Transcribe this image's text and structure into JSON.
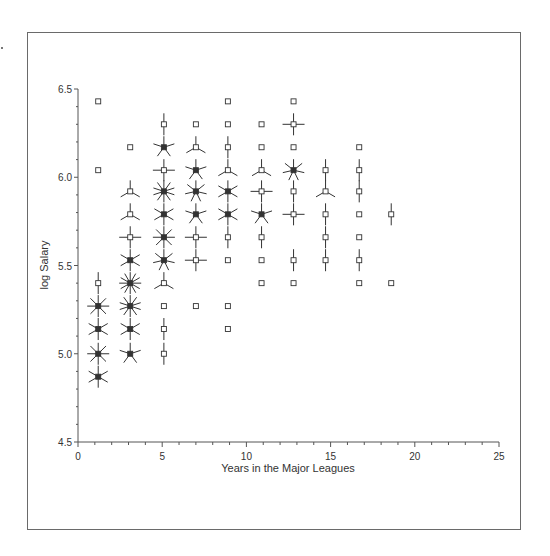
{
  "chart_data": {
    "type": "scatter",
    "subtype": "sunflower",
    "title": "",
    "xlabel": "Years in the Major Leagues",
    "ylabel": "log Salary",
    "xlim": [
      0,
      25
    ],
    "ylim": [
      4.5,
      6.5
    ],
    "xticks": [
      "0",
      "5",
      "10",
      "15",
      "20",
      "25"
    ],
    "yticks": [
      "4.5",
      "5.0",
      "5.5",
      "6.0",
      "6.5"
    ],
    "grid": false,
    "legend": null,
    "note": "Each point is a sunflower; petals = count of observations in the bin (1 = plain square).",
    "points": [
      {
        "x": 1.2,
        "y": 6.43,
        "n": 1
      },
      {
        "x": 1.2,
        "y": 6.04,
        "n": 1
      },
      {
        "x": 1.2,
        "y": 5.4,
        "n": 2
      },
      {
        "x": 1.2,
        "y": 5.27,
        "n": 8
      },
      {
        "x": 1.2,
        "y": 5.14,
        "n": 6
      },
      {
        "x": 1.2,
        "y": 5.0,
        "n": 8
      },
      {
        "x": 1.2,
        "y": 4.87,
        "n": 6
      },
      {
        "x": 3.1,
        "y": 6.17,
        "n": 1
      },
      {
        "x": 3.1,
        "y": 5.92,
        "n": 3
      },
      {
        "x": 3.1,
        "y": 5.79,
        "n": 3
      },
      {
        "x": 3.1,
        "y": 5.66,
        "n": 4
      },
      {
        "x": 3.1,
        "y": 5.53,
        "n": 6
      },
      {
        "x": 3.1,
        "y": 5.4,
        "n": 12
      },
      {
        "x": 3.1,
        "y": 5.27,
        "n": 10
      },
      {
        "x": 3.1,
        "y": 5.14,
        "n": 6
      },
      {
        "x": 3.1,
        "y": 5.0,
        "n": 5
      },
      {
        "x": 5.1,
        "y": 6.3,
        "n": 2
      },
      {
        "x": 5.1,
        "y": 6.17,
        "n": 5
      },
      {
        "x": 5.1,
        "y": 6.04,
        "n": 4
      },
      {
        "x": 5.1,
        "y": 5.92,
        "n": 10
      },
      {
        "x": 5.1,
        "y": 5.79,
        "n": 6
      },
      {
        "x": 5.1,
        "y": 5.66,
        "n": 8
      },
      {
        "x": 5.1,
        "y": 5.53,
        "n": 7
      },
      {
        "x": 5.1,
        "y": 5.4,
        "n": 3
      },
      {
        "x": 5.1,
        "y": 5.27,
        "n": 1
      },
      {
        "x": 5.1,
        "y": 5.14,
        "n": 2
      },
      {
        "x": 5.1,
        "y": 5.0,
        "n": 2
      },
      {
        "x": 7.0,
        "y": 6.3,
        "n": 1
      },
      {
        "x": 7.0,
        "y": 6.17,
        "n": 3
      },
      {
        "x": 7.0,
        "y": 6.04,
        "n": 5
      },
      {
        "x": 7.0,
        "y": 5.92,
        "n": 7
      },
      {
        "x": 7.0,
        "y": 5.79,
        "n": 5
      },
      {
        "x": 7.0,
        "y": 5.66,
        "n": 4
      },
      {
        "x": 7.0,
        "y": 5.53,
        "n": 4
      },
      {
        "x": 7.0,
        "y": 5.27,
        "n": 1
      },
      {
        "x": 8.9,
        "y": 6.43,
        "n": 1
      },
      {
        "x": 8.9,
        "y": 6.3,
        "n": 1
      },
      {
        "x": 8.9,
        "y": 6.17,
        "n": 2
      },
      {
        "x": 8.9,
        "y": 6.04,
        "n": 3
      },
      {
        "x": 8.9,
        "y": 5.92,
        "n": 6
      },
      {
        "x": 8.9,
        "y": 5.79,
        "n": 6
      },
      {
        "x": 8.9,
        "y": 5.66,
        "n": 2
      },
      {
        "x": 8.9,
        "y": 5.53,
        "n": 1
      },
      {
        "x": 8.9,
        "y": 5.27,
        "n": 1
      },
      {
        "x": 8.9,
        "y": 5.14,
        "n": 1
      },
      {
        "x": 10.9,
        "y": 6.3,
        "n": 1
      },
      {
        "x": 10.9,
        "y": 6.17,
        "n": 1
      },
      {
        "x": 10.9,
        "y": 6.04,
        "n": 3
      },
      {
        "x": 10.9,
        "y": 5.92,
        "n": 4
      },
      {
        "x": 10.9,
        "y": 5.79,
        "n": 5
      },
      {
        "x": 10.9,
        "y": 5.66,
        "n": 2
      },
      {
        "x": 10.9,
        "y": 5.53,
        "n": 1
      },
      {
        "x": 10.9,
        "y": 5.4,
        "n": 1
      },
      {
        "x": 12.8,
        "y": 6.43,
        "n": 1
      },
      {
        "x": 12.8,
        "y": 6.3,
        "n": 4
      },
      {
        "x": 12.8,
        "y": 6.17,
        "n": 1
      },
      {
        "x": 12.8,
        "y": 6.04,
        "n": 7
      },
      {
        "x": 12.8,
        "y": 5.92,
        "n": 2
      },
      {
        "x": 12.8,
        "y": 5.79,
        "n": 4
      },
      {
        "x": 12.8,
        "y": 5.53,
        "n": 2
      },
      {
        "x": 12.8,
        "y": 5.4,
        "n": 1
      },
      {
        "x": 14.7,
        "y": 6.04,
        "n": 2
      },
      {
        "x": 14.7,
        "y": 5.92,
        "n": 3
      },
      {
        "x": 14.7,
        "y": 5.79,
        "n": 2
      },
      {
        "x": 14.7,
        "y": 5.66,
        "n": 2
      },
      {
        "x": 14.7,
        "y": 5.53,
        "n": 2
      },
      {
        "x": 16.7,
        "y": 6.17,
        "n": 1
      },
      {
        "x": 16.7,
        "y": 6.04,
        "n": 2
      },
      {
        "x": 16.7,
        "y": 5.92,
        "n": 2
      },
      {
        "x": 16.7,
        "y": 5.79,
        "n": 1
      },
      {
        "x": 16.7,
        "y": 5.66,
        "n": 1
      },
      {
        "x": 16.7,
        "y": 5.53,
        "n": 2
      },
      {
        "x": 16.7,
        "y": 5.4,
        "n": 1
      },
      {
        "x": 18.6,
        "y": 5.79,
        "n": 2
      },
      {
        "x": 18.6,
        "y": 5.4,
        "n": 1
      }
    ]
  },
  "style": {
    "frame_color": "#6a6a6a",
    "axis_color": "#555555",
    "marker_color": "#333333",
    "background": "#ffffff"
  }
}
